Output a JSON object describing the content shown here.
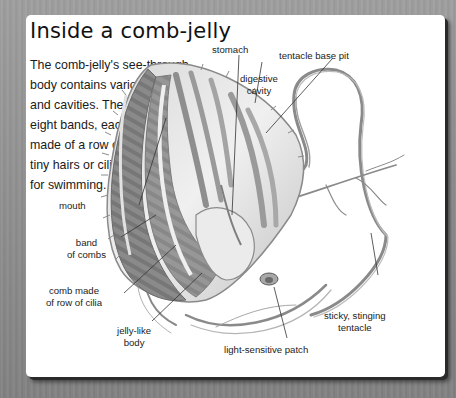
{
  "title": "Inside a comb-jelly",
  "intro": {
    "lines": [
      "The comb-jelly's see-through",
      "body contains various chambers",
      "and cavities. There are",
      "eight bands, each",
      "made of a row of",
      "tiny hairs or cilia,",
      "for swimming."
    ]
  },
  "labels": {
    "stomach": "stomach",
    "tentacle_base_pit": "tentacle base pit",
    "digestive_cavity": [
      "digestive",
      "cavity"
    ],
    "mouth": "mouth",
    "band_of_combs": [
      "band",
      "of combs"
    ],
    "comb_made_of_cilia": [
      "comb made",
      "of row of cilia"
    ],
    "jelly_like_body": [
      "jelly-like",
      "body"
    ],
    "light_sensitive_patch": "light-sensitive patch",
    "sticky_stinging_tentacle": [
      "sticky, stinging",
      "tentacle"
    ]
  },
  "colors": {
    "card": "#ffffff",
    "background": "#909090",
    "text": "#1a1a1a",
    "leader_line": "#333333",
    "body_shade": "#9a9a9a"
  }
}
